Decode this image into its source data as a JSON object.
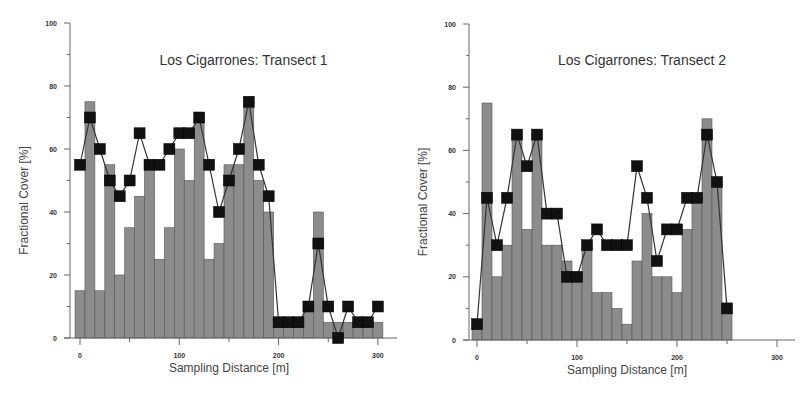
{
  "chart_data": [
    {
      "type": "bar",
      "title": "Los Cigarrones: Transect 1",
      "xlabel": "Sampling Distance [m]",
      "ylabel": "Fractional Cover [%]",
      "xlim": [
        -10,
        320
      ],
      "ylim": [
        0,
        100
      ],
      "xticks": [
        0,
        100,
        200,
        300
      ],
      "yticks": [
        0,
        20,
        40,
        60,
        80,
        100
      ],
      "grid": false,
      "x": [
        0,
        10,
        20,
        30,
        40,
        50,
        60,
        70,
        80,
        90,
        100,
        110,
        120,
        130,
        140,
        150,
        160,
        170,
        180,
        190,
        200,
        210,
        220,
        230,
        240,
        250,
        260,
        270,
        280,
        290,
        300
      ],
      "series": [
        {
          "name": "bars",
          "type": "bar",
          "color": "#8c8c8c",
          "values": [
            15,
            75,
            15,
            55,
            20,
            35,
            45,
            55,
            25,
            35,
            60,
            50,
            70,
            25,
            30,
            55,
            55,
            75,
            50,
            40,
            5,
            5,
            5,
            10,
            40,
            5,
            5,
            5,
            5,
            5,
            5
          ]
        },
        {
          "name": "line",
          "type": "line",
          "marker": "square",
          "color": "#111111",
          "values": [
            55,
            70,
            60,
            50,
            45,
            50,
            65,
            55,
            55,
            60,
            65,
            65,
            70,
            55,
            40,
            50,
            60,
            75,
            55,
            45,
            5,
            5,
            5,
            10,
            30,
            10,
            0,
            10,
            5,
            5,
            10
          ]
        }
      ]
    },
    {
      "type": "bar",
      "title": "Los Cigarrones: Transect 2",
      "xlabel": "Sampling Distance [m]",
      "ylabel": "Fractional Cover [%]",
      "xlim": [
        -10,
        320
      ],
      "ylim": [
        0,
        100
      ],
      "xticks": [
        0,
        100,
        200,
        300
      ],
      "yticks": [
        0,
        20,
        40,
        60,
        80,
        100
      ],
      "grid": false,
      "x": [
        0,
        10,
        20,
        30,
        40,
        50,
        60,
        70,
        80,
        90,
        100,
        110,
        120,
        130,
        140,
        150,
        160,
        170,
        180,
        190,
        200,
        210,
        220,
        230,
        240,
        250
      ],
      "series": [
        {
          "name": "bars",
          "type": "bar",
          "color": "#8c8c8c",
          "values": [
            5,
            75,
            20,
            30,
            65,
            35,
            65,
            30,
            30,
            25,
            20,
            30,
            15,
            15,
            10,
            5,
            25,
            40,
            20,
            20,
            15,
            35,
            45,
            70,
            50,
            10
          ]
        },
        {
          "name": "line",
          "type": "line",
          "marker": "square",
          "color": "#111111",
          "values": [
            5,
            45,
            30,
            45,
            65,
            55,
            65,
            40,
            40,
            20,
            20,
            30,
            35,
            30,
            30,
            30,
            55,
            45,
            25,
            35,
            35,
            45,
            45,
            65,
            50,
            10
          ]
        }
      ]
    }
  ],
  "layout": [
    {
      "x0": 80,
      "xscale": 0.993,
      "y0": 338,
      "yscale": 3.15,
      "yaxis_x": 70,
      "xaxis_end": 397
    },
    {
      "x0": 477,
      "xscale": 1.0,
      "y0": 340,
      "yscale": 3.16,
      "yaxis_x": 469,
      "xaxis_end": 795
    }
  ]
}
